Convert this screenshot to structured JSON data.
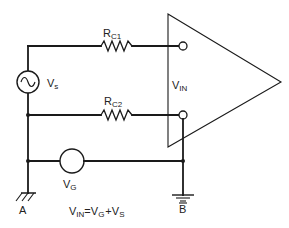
{
  "diagram": {
    "type": "circuit-schematic",
    "components": {
      "source": {
        "label": "V",
        "subscript": "s"
      },
      "rc1": {
        "label": "R",
        "subscript": "C1"
      },
      "rc2": {
        "label": "R",
        "subscript": "C2"
      },
      "ground_voltage": {
        "label": "V",
        "subscript": "G"
      },
      "amplifier_input": {
        "label": "V",
        "subscript": "IN"
      }
    },
    "grounds": {
      "a": {
        "label": "A"
      },
      "b": {
        "label": "B"
      }
    },
    "equation": {
      "lhs": "V",
      "lhs_sub": "IN",
      "eq": "=",
      "t1": "V",
      "t1_sub": "G",
      "plus": "+",
      "t2": "V",
      "t2_sub": "S"
    }
  }
}
